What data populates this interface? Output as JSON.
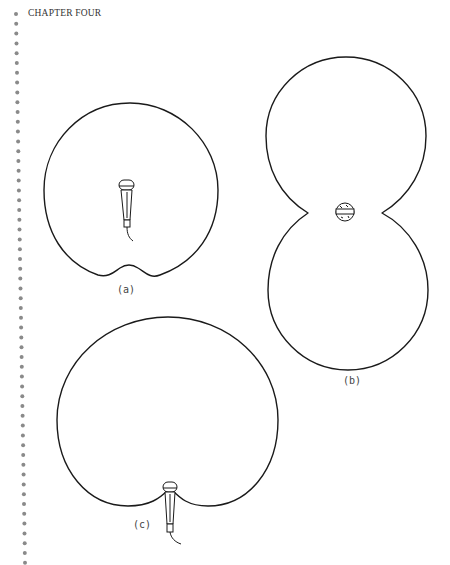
{
  "page": {
    "running_head": "CHAPTER FOUR",
    "margin_dots_color": "#8a8a8a",
    "line_color": "#1a1a1a"
  },
  "figures": [
    {
      "id": "a",
      "label": "(a)",
      "pattern": "omnidirectional",
      "mic_orientation": "upright"
    },
    {
      "id": "b",
      "label": "(b)",
      "pattern": "bidirectional (figure-8)",
      "mic_orientation": "side view"
    },
    {
      "id": "c",
      "label": "(c)",
      "pattern": "cardioid",
      "mic_orientation": "upright at rear null"
    }
  ]
}
